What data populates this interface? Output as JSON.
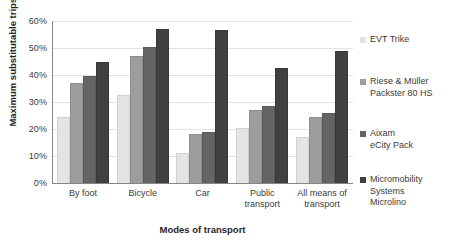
{
  "chart_data": {
    "type": "bar",
    "title": "",
    "xlabel": "Modes of transport",
    "ylabel": "Maximum substitutable trips [%]",
    "ylim": [
      0,
      60
    ],
    "ytick_labels": [
      "60%",
      "50%",
      "40%",
      "30%",
      "20%",
      "10%",
      "0%"
    ],
    "ytick_values": [
      60,
      50,
      40,
      30,
      20,
      10,
      0
    ],
    "grid": "horizontal",
    "legend_position": "right",
    "categories": [
      "By foot",
      "Bicycle",
      "Car",
      "Public\ntransport",
      "All means of\ntransport"
    ],
    "series": [
      {
        "name": "EVT Trike",
        "color": "#e4e4e4",
        "values": [
          24.5,
          32.5,
          11.0,
          20.5,
          17.0
        ]
      },
      {
        "name": "Riese & Müller\nPackster 80 HS",
        "color": "#9d9d9d",
        "values": [
          37.0,
          47.0,
          18.0,
          27.0,
          24.5
        ]
      },
      {
        "name": "Aixam\neCity Pack",
        "color": "#646464",
        "values": [
          39.5,
          50.5,
          19.0,
          28.5,
          26.0
        ]
      },
      {
        "name": "Micromobility\nSystems\nMicrolino",
        "color": "#404040",
        "values": [
          45.0,
          57.0,
          56.5,
          42.5,
          49.0
        ]
      }
    ]
  },
  "axis_colors": {
    "axis_line": "#868686",
    "gridline": "#e2e2e2",
    "text": "#3b3b3b"
  }
}
